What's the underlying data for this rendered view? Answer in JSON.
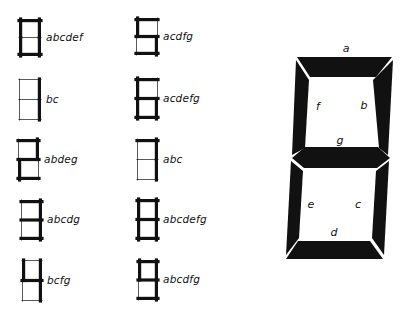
{
  "colors": {
    "ink": "#111111",
    "paper": "#ffffff"
  },
  "digits": [
    {
      "digit": "0",
      "code": "abcdef",
      "segments": [
        "a",
        "b",
        "c",
        "d",
        "e",
        "f"
      ],
      "x": 19,
      "y": 19,
      "w": 22,
      "h": 37
    },
    {
      "digit": "1",
      "code": "bc",
      "segments": [
        "b",
        "c"
      ],
      "x": 19,
      "y": 79,
      "w": 22,
      "h": 41
    },
    {
      "digit": "2",
      "code": "abdeg",
      "segments": [
        "a",
        "b",
        "d",
        "e",
        "g"
      ],
      "x": 18,
      "y": 139,
      "w": 21,
      "h": 41
    },
    {
      "digit": "3",
      "code": "abcdg",
      "segments": [
        "a",
        "b",
        "c",
        "d",
        "g"
      ],
      "x": 21,
      "y": 200,
      "w": 21,
      "h": 40
    },
    {
      "digit": "4",
      "code": "bcfg",
      "segments": [
        "b",
        "c",
        "f",
        "g"
      ],
      "x": 22,
      "y": 260,
      "w": 20,
      "h": 41
    },
    {
      "digit": "5",
      "code": "acdfg",
      "segments": [
        "a",
        "c",
        "d",
        "f",
        "g"
      ],
      "x": 136,
      "y": 18,
      "w": 22,
      "h": 37
    },
    {
      "digit": "6",
      "code": "acdefg",
      "segments": [
        "a",
        "c",
        "d",
        "e",
        "f",
        "g"
      ],
      "x": 136,
      "y": 78,
      "w": 22,
      "h": 41
    },
    {
      "digit": "7",
      "code": "abc",
      "segments": [
        "a",
        "b",
        "c"
      ],
      "x": 137,
      "y": 139,
      "w": 21,
      "h": 41
    },
    {
      "digit": "8",
      "code": "abcdefg",
      "segments": [
        "a",
        "b",
        "c",
        "d",
        "e",
        "f",
        "g"
      ],
      "x": 137,
      "y": 199,
      "w": 21,
      "h": 41
    },
    {
      "digit": "9",
      "code": "abcdfg",
      "segments": [
        "a",
        "b",
        "c",
        "d",
        "f",
        "g"
      ],
      "x": 138,
      "y": 260,
      "w": 20,
      "h": 40
    }
  ],
  "large_digit": {
    "segment_labels": [
      {
        "id": "a",
        "text": "a",
        "x": 346,
        "y": 52
      },
      {
        "id": "b",
        "text": "b",
        "x": 364,
        "y": 109
      },
      {
        "id": "c",
        "text": "c",
        "x": 358,
        "y": 208
      },
      {
        "id": "d",
        "text": "d",
        "x": 334,
        "y": 236
      },
      {
        "id": "e",
        "text": "e",
        "x": 311,
        "y": 208
      },
      {
        "id": "f",
        "text": "f",
        "x": 318,
        "y": 110
      },
      {
        "id": "g",
        "text": "g",
        "x": 340,
        "y": 144
      }
    ]
  }
}
